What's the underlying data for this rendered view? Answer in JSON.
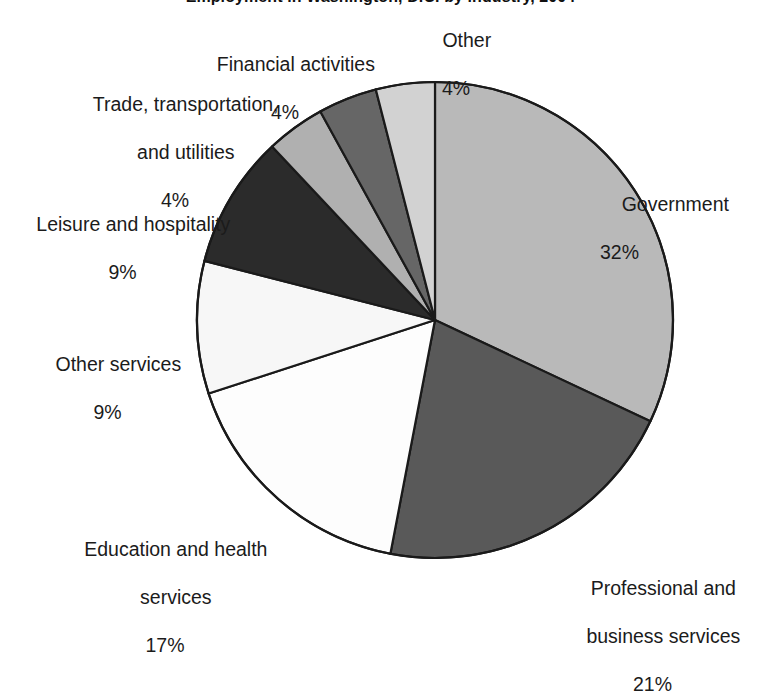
{
  "chart_data": {
    "type": "pie",
    "title": "Employment in Washington, D.C. by industry, 2004",
    "xlabel": "",
    "ylabel": "",
    "grid": false,
    "legend": "none (direct slice labels)",
    "labels_show_percent": true,
    "categories": [
      "Government",
      "Professional and business services",
      "Education and health services",
      "Other services",
      "Leisure and hospitality",
      "Trade, transportation, and utilities",
      "Financial activities",
      "Other"
    ],
    "values": [
      32,
      21,
      17,
      9,
      9,
      4,
      4,
      4
    ],
    "slices": [
      {
        "name": "Government",
        "label": "Government",
        "percent_text": "32%",
        "value": 32,
        "color": "#b9b9b9",
        "start_angle": 0,
        "end_angle": 115.2
      },
      {
        "name": "Professional and business services",
        "label": "Professional and\nbusiness services",
        "percent_text": "21%",
        "value": 21,
        "color": "#595959",
        "start_angle": 115.2,
        "end_angle": 190.8
      },
      {
        "name": "Education and health services",
        "label": "Education and health\nservices",
        "percent_text": "17%",
        "value": 17,
        "color": "#fdfdfd",
        "start_angle": 190.8,
        "end_angle": 252.0
      },
      {
        "name": "Other services",
        "label": "Other services",
        "percent_text": "9%",
        "value": 9,
        "color": "#f7f7f7",
        "start_angle": 252.0,
        "end_angle": 284.4
      },
      {
        "name": "Leisure and hospitality",
        "label": "Leisure and hospitality",
        "percent_text": "9%",
        "value": 9,
        "color": "#2b2b2b",
        "start_angle": 284.4,
        "end_angle": 316.8
      },
      {
        "name": "Trade, transportation, and utilities",
        "label": "Trade, transportation,\nand utilities",
        "percent_text": "4%",
        "value": 4,
        "color": "#b0b0b0",
        "start_angle": 316.8,
        "end_angle": 331.2
      },
      {
        "name": "Financial activities",
        "label": "Financial activities",
        "percent_text": "4%",
        "value": 4,
        "color": "#666666",
        "start_angle": 331.2,
        "end_angle": 345.6
      },
      {
        "name": "Other",
        "label": "Other",
        "percent_text": "4%",
        "value": 4,
        "color": "#d2d2d2",
        "start_angle": 345.6,
        "end_angle": 360.0
      }
    ],
    "geometry": {
      "center_x": 435,
      "center_y": 320,
      "radius": 238,
      "stroke_color": "#1a1a1a",
      "stroke_width": 2.2
    }
  },
  "labels": {
    "other": {
      "name": "Other",
      "percent": "4%"
    },
    "financial": {
      "name": "Financial activities",
      "percent": "4%"
    },
    "trade_l1": "Trade, transportation,",
    "trade_l2": "and utilities",
    "trade_pct": "4%",
    "leisure": {
      "name": "Leisure and hospitality",
      "percent": "9%"
    },
    "other_services": {
      "name": "Other services",
      "percent": "9%"
    },
    "education_l1": "Education and health",
    "education_l2": "services",
    "education_pct": "17%",
    "professional_l1": "Professional and",
    "professional_l2": "business services",
    "professional_pct": "21%",
    "government": {
      "name": "Government",
      "percent": "32%"
    }
  }
}
